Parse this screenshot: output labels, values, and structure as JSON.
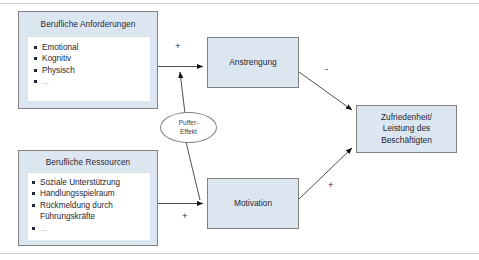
{
  "diagram": {
    "type": "path-model",
    "colors": {
      "node_fill": "#dce6f1",
      "node_border": "#808080",
      "inner_fill": "#ffffff",
      "text": "#1f2833",
      "frame_line": "#c9cfd8"
    },
    "groups": [
      {
        "id": "anforderungen",
        "title": "Berufliche Anforderungen",
        "items": [
          "Emotional",
          "Kognitiv",
          "Physisch",
          "..."
        ]
      },
      {
        "id": "ressourcen",
        "title": "Berufliche Ressourcen",
        "items": [
          "Soziale Unterstützung",
          "Handlungsspielraum",
          "Rückmeldung durch\nFührungskräfte",
          "..."
        ]
      }
    ],
    "nodes": [
      {
        "id": "anstrengung",
        "label": "Anstrengung"
      },
      {
        "id": "motivation",
        "label": "Motivation"
      },
      {
        "id": "outcome",
        "label": "Zufriedenheit/\nLeistung des\nBeschäftigten"
      }
    ],
    "moderator": {
      "id": "puffer",
      "label": "Puffer-\nEffekt"
    },
    "edges": [
      {
        "from": "anforderungen",
        "to": "anstrengung",
        "sign": "+"
      },
      {
        "from": "anstrengung",
        "to": "outcome",
        "sign": "-"
      },
      {
        "from": "ressourcen",
        "to": "motivation",
        "sign": "+"
      },
      {
        "from": "motivation",
        "to": "outcome",
        "sign": "+"
      },
      {
        "from": "puffer",
        "to": "anforderungen-anstrengung-path",
        "sign": ""
      }
    ]
  }
}
